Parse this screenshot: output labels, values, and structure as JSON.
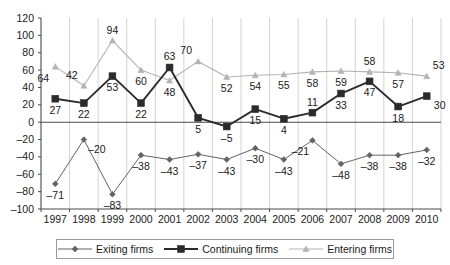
{
  "chart_data": {
    "type": "line",
    "title": "",
    "subtitle": "",
    "xlabel": "",
    "ylabel": "",
    "categories": [
      "1997",
      "1998",
      "1999",
      "2000",
      "2001",
      "2002",
      "2003",
      "2004",
      "2005",
      "2006",
      "2007",
      "2008",
      "2009",
      "2010"
    ],
    "ylim": [
      -100,
      120
    ],
    "ytick_step": 20,
    "yticks": [
      "120",
      "100",
      "80",
      "60",
      "40",
      "20",
      "0",
      "-20",
      "-40",
      "-60",
      "-80",
      "-100"
    ],
    "grid": "vertical-only",
    "legend_position": "bottom",
    "zero_line": true,
    "series": [
      {
        "name": "Exiting firms",
        "marker": "diamond",
        "color": "#636363",
        "values": [
          -71,
          -20,
          -83,
          -38,
          -43,
          -37,
          -43,
          -30,
          -43,
          -21,
          -48,
          -38,
          -38,
          -32
        ],
        "labels": [
          "-71",
          "-20",
          "-83",
          "-38",
          "-43",
          "-37",
          "-43",
          "-30",
          "-43",
          "-21",
          "-48",
          "-38",
          "-38",
          "-32"
        ],
        "label_pos": [
          "below",
          "below-right",
          "below",
          "below",
          "below",
          "below",
          "below",
          "below",
          "below",
          "below-left",
          "below",
          "below",
          "below",
          "below"
        ]
      },
      {
        "name": "Continuing firms",
        "marker": "square",
        "color": "#2b2b2b",
        "values": [
          27,
          22,
          53,
          22,
          63,
          5,
          -5,
          15,
          4,
          11,
          33,
          47,
          18,
          30
        ],
        "labels": [
          "27",
          "22",
          "53",
          "22",
          "63",
          "5",
          "-5",
          "15",
          "4",
          "11",
          "33",
          "47",
          "18",
          "30"
        ],
        "label_pos": [
          "below",
          "below",
          "below",
          "below",
          "above",
          "below",
          "below",
          "below",
          "below",
          "above",
          "below",
          "below",
          "below",
          "below-right"
        ]
      },
      {
        "name": "Entering firms",
        "marker": "triangle",
        "color": "#b3b3b3",
        "values": [
          64,
          42,
          94,
          60,
          48,
          70,
          52,
          54,
          55,
          58,
          59,
          58,
          57,
          53
        ],
        "labels": [
          "64",
          "42",
          "94",
          "60",
          "48",
          "70",
          "52",
          "54",
          "55",
          "58",
          "59",
          "58",
          "57",
          "53"
        ],
        "label_pos": [
          "below-left",
          "above-left",
          "above",
          "below",
          "below",
          "above-left",
          "below",
          "below",
          "below",
          "below",
          "below",
          "above",
          "below",
          "above-right"
        ]
      }
    ]
  },
  "legend": {
    "items": [
      {
        "label": "Exiting firms",
        "marker": "diamond",
        "color": "#636363"
      },
      {
        "label": "Continuing firms",
        "marker": "square",
        "color": "#2b2b2b"
      },
      {
        "label": "Entering firms",
        "marker": "triangle",
        "color": "#b3b3b3"
      }
    ]
  }
}
